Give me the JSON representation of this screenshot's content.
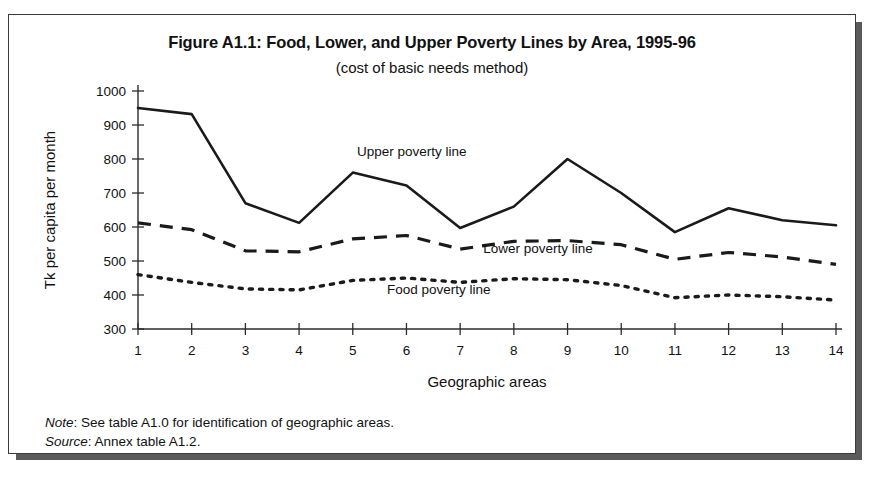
{
  "figure": {
    "title": "Figure A1.1: Food, Lower, and Upper Poverty Lines by Area, 1995-96",
    "subtitle": "(cost of basic needs method)"
  },
  "notes": {
    "note_keyword": "Note",
    "note_sep": ": ",
    "note_text": "See table A1.0 for identification of geographic areas.",
    "source_keyword": "Source",
    "source_sep": ": ",
    "source_text": "Annex table A1.2."
  },
  "labels": {
    "upper": "Upper poverty line",
    "lower": "Lower poverty line",
    "food": "Food poverty line"
  },
  "chart_data": {
    "type": "line",
    "title": "Figure A1.1: Food, Lower, and Upper Poverty Lines by Area, 1995-96",
    "subtitle": "(cost of basic needs method)",
    "xlabel": "Geographic areas",
    "ylabel": "Tk per capita per month",
    "categories": [
      "1",
      "2",
      "3",
      "4",
      "5",
      "6",
      "7",
      "8",
      "9",
      "10",
      "11",
      "12",
      "13",
      "14"
    ],
    "x": [
      1,
      2,
      3,
      4,
      5,
      6,
      7,
      8,
      9,
      10,
      11,
      12,
      13,
      14
    ],
    "xlim": [
      1,
      14
    ],
    "ylim": [
      300,
      1000
    ],
    "ytick_labels": [
      "300",
      "400",
      "500",
      "600",
      "700",
      "800",
      "900",
      "1000"
    ],
    "yticks": [
      300,
      400,
      500,
      600,
      700,
      800,
      900,
      1000
    ],
    "grid": false,
    "legend_position": "inline-annotations",
    "series": [
      {
        "name": "Upper poverty line",
        "style": "solid",
        "values": [
          950,
          932,
          670,
          612,
          760,
          722,
          597,
          660,
          800,
          700,
          585,
          655,
          620,
          605
        ]
      },
      {
        "name": "Lower poverty line",
        "style": "dashed",
        "values": [
          612,
          592,
          530,
          527,
          565,
          575,
          535,
          558,
          560,
          548,
          505,
          525,
          512,
          490
        ]
      },
      {
        "name": "Food poverty line",
        "style": "dotted",
        "values": [
          460,
          437,
          418,
          415,
          443,
          450,
          437,
          448,
          445,
          428,
          392,
          400,
          395,
          385
        ]
      }
    ],
    "annotations": [
      {
        "text": "Upper poverty line",
        "x": 6.1,
        "y": 808
      },
      {
        "text": "Lower poverty line",
        "x": 8.45,
        "y": 525
      },
      {
        "text": "Food poverty line",
        "x": 6.6,
        "y": 402
      }
    ]
  }
}
